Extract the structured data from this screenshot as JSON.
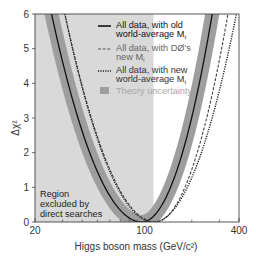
{
  "chart_data": {
    "type": "line",
    "title": "",
    "xlabel": "Higgs boson mass (GeV/c²)",
    "ylabel": "Δχ²",
    "xscale": "log",
    "xlim": [
      20,
      400
    ],
    "ylim": [
      0,
      6
    ],
    "x_ticks": [
      20,
      100,
      400
    ],
    "x_tick_labels": [
      "20",
      "100",
      "400"
    ],
    "y_ticks": [
      0,
      1,
      2,
      3,
      4,
      5,
      6
    ],
    "y_tick_labels": [
      "0",
      "1",
      "2",
      "3",
      "4",
      "5",
      "6"
    ],
    "grid": false,
    "legend_position": "upper right (inside)",
    "excluded_region": {
      "label_lines": [
        "Region",
        "excluded by",
        "direct searches"
      ],
      "x_range": [
        20,
        114
      ],
      "color": "#d9d9d9"
    },
    "series": [
      {
        "name": "All data, with old world-average Mt",
        "legend_lines": [
          "All data, with old",
          "world-average M"
        ],
        "legend_sub": "t",
        "style": "solid",
        "color": "#111111",
        "min_x": 96,
        "x_at_y6": [
          25.5,
          270
        ],
        "x": [
          25.5,
          35,
          50,
          70,
          96,
          130,
          180,
          270
        ],
        "y": [
          6,
          4.3,
          2.4,
          0.9,
          0,
          0.8,
          2.7,
          6
        ]
      },
      {
        "name": "All data, with DØ's new Mt",
        "legend_lines": [
          "All data, with DØ's",
          "new M"
        ],
        "legend_sub": "t",
        "style": "dashed",
        "color": "#444444",
        "min_x": 117,
        "x_at_y6": [
          31,
          340
        ],
        "x": [
          31,
          45,
          65,
          90,
          117,
          160,
          230,
          340
        ],
        "y": [
          6,
          4.2,
          2.4,
          0.9,
          0,
          0.9,
          2.8,
          6
        ]
      },
      {
        "name": "All data, with new world-average Mt",
        "legend_lines": [
          "All data, with new",
          "world-average M"
        ],
        "legend_sub": "t",
        "style": "dotted",
        "color": "#222222",
        "min_x": 114,
        "x_at_y6": [
          31,
          385
        ],
        "x": [
          31,
          45,
          65,
          90,
          114,
          160,
          240,
          385
        ],
        "y": [
          6,
          4.2,
          2.4,
          0.9,
          0,
          1.0,
          3.0,
          6
        ]
      }
    ],
    "band": {
      "name": "Theory uncertainty",
      "color": "#9e9e9e",
      "around_series": "All data, with old world-average Mt",
      "half_width_px": 7
    },
    "annotations": [
      "Region excluded by direct searches"
    ]
  },
  "legend": {
    "theory_label": "Theory uncertainty"
  }
}
